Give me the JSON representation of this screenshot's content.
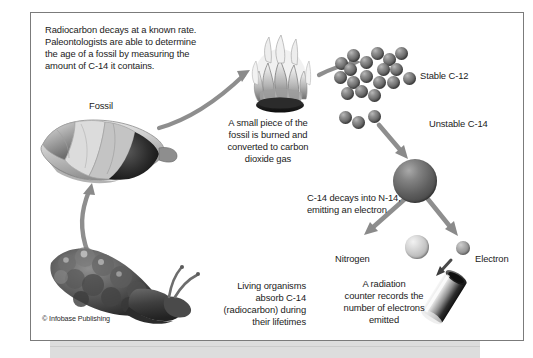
{
  "diagram": {
    "title_text": "Radiocarbon decays at a known rate.\nPaleontologists are able to determine\nthe age of a fossil by measuring the\namount of C-14 it contains.",
    "copyright": "© Infobase Publishing",
    "labels": {
      "fossil": "Fossil",
      "burn_caption": "A small piece of the\nfossil is burned and\nconverted to carbon\ndioxide gas",
      "stable_c12": "Stable C-12",
      "unstable_c14": "Unstable C-14",
      "decay_caption": "C-14 decays into N-14,\nemitting an electron",
      "nitrogen": "Nitrogen",
      "electron": "Electron",
      "counter_caption": "A radiation\ncounter records the\nnumber of electrons\nemitted",
      "living_caption": "Living organisms\nabsorb C-14\n(radiocarbon) during\ntheir lifetimes"
    },
    "colors": {
      "frame_border": "#7b7b7b",
      "background": "#ffffff",
      "text": "#1b1b1b",
      "arrow": "#8a8a8a",
      "carbon_sphere": "#5e5e5e",
      "nitrogen_sphere": "#c9c9c9",
      "electron_sphere": "#9a9a9a",
      "bottom_band": "#d8d8d8"
    },
    "icons": {
      "fossil": "shell-fossil-icon",
      "flame": "flame-icon",
      "snail": "snail-icon",
      "counter": "radiation-counter-icon"
    },
    "counts": {
      "c12_spheres": 18,
      "c14_spheres": 3
    }
  }
}
